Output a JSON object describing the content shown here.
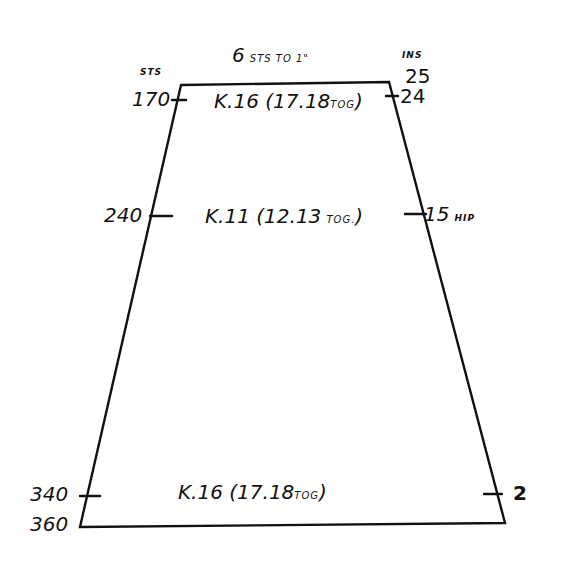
{
  "title": {
    "main": "6",
    "rest": "STS TO 1\""
  },
  "left_axis": {
    "header": "STS",
    "marks": [
      {
        "value": "170"
      },
      {
        "value": "240"
      },
      {
        "value": "340"
      },
      {
        "value": "360"
      }
    ]
  },
  "right_axis": {
    "header": "INS",
    "marks": [
      {
        "value": "25"
      },
      {
        "value": "24"
      },
      {
        "value": "15",
        "note": "HIP"
      },
      {
        "value": "2"
      }
    ]
  },
  "instructions": [
    {
      "main": "K.16 (17.18",
      "small": "TOG",
      "end": ")"
    },
    {
      "main": "K.11 (12.13",
      "small": "TOG.",
      "end": ")"
    },
    {
      "main": "K.16 (17.18",
      "small": "TOG",
      "end": ")"
    }
  ],
  "colors": {
    "ink": "#111111",
    "paper": "#ffffff"
  }
}
